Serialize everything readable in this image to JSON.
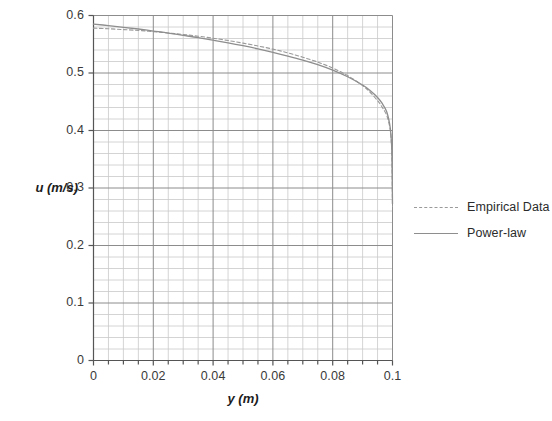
{
  "chart_data": {
    "type": "line",
    "title": "",
    "xlabel": "y (m)",
    "ylabel": "u (m/s)",
    "xlim": [
      0,
      0.1
    ],
    "ylim": [
      0,
      0.6
    ],
    "xticks": [
      "0",
      "0.02",
      "0.04",
      "0.06",
      "0.08",
      "0.1"
    ],
    "xtick_values": [
      0,
      0.02,
      0.04,
      0.06,
      0.08,
      0.1
    ],
    "yticks": [
      "0",
      "0.1",
      "0.2",
      "0.3",
      "0.4",
      "0.5",
      "0.6"
    ],
    "ytick_values": [
      0,
      0.1,
      0.2,
      0.3,
      0.4,
      0.5,
      0.6
    ],
    "x_major_step": 0.02,
    "x_minor_step": 0.005,
    "y_major_step": 0.1,
    "y_minor_step": 0.02,
    "grid": true,
    "legend_position": "right",
    "x": [
      0,
      0.005,
      0.01,
      0.015,
      0.02,
      0.025,
      0.03,
      0.035,
      0.04,
      0.045,
      0.05,
      0.055,
      0.06,
      0.065,
      0.07,
      0.075,
      0.08,
      0.085,
      0.09,
      0.0925,
      0.095,
      0.0965,
      0.098,
      0.099,
      0.0995,
      0.0998,
      0.1
    ],
    "series": [
      {
        "name": "Empirical Data",
        "style": "dashed",
        "color": "#9a9a9a",
        "values": [
          0.578,
          0.577,
          0.5755,
          0.574,
          0.572,
          0.5695,
          0.567,
          0.564,
          0.5605,
          0.5565,
          0.552,
          0.547,
          0.5415,
          0.535,
          0.5275,
          0.519,
          0.5085,
          0.4955,
          0.478,
          0.4665,
          0.452,
          0.441,
          0.427,
          0.408,
          0.388,
          0.355,
          0.268
        ]
      },
      {
        "name": "Power-law",
        "style": "solid",
        "color": "#8e8e8e",
        "values": [
          0.585,
          0.5825,
          0.5795,
          0.5765,
          0.573,
          0.5695,
          0.5655,
          0.5615,
          0.557,
          0.5525,
          0.5475,
          0.542,
          0.536,
          0.5295,
          0.5225,
          0.5145,
          0.505,
          0.4935,
          0.479,
          0.4695,
          0.4575,
          0.4475,
          0.4335,
          0.413,
          0.392,
          0.358,
          0.272
        ]
      }
    ]
  },
  "legend": {
    "items": [
      {
        "label": "Empirical Data",
        "color": "#9a9a9a",
        "style": "dashed"
      },
      {
        "label": "Power-law",
        "color": "#8e8e8e",
        "style": "solid"
      }
    ]
  },
  "axes": {
    "x_title": "y (m)",
    "y_title": "u (m/s)"
  }
}
